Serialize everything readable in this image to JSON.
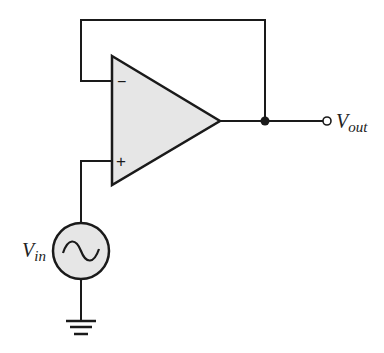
{
  "diagram": {
    "type": "op-amp voltage follower",
    "labels": {
      "input_main": "V",
      "input_sub": "in",
      "output_main": "V",
      "output_sub": "out",
      "inverting_symbol": "−",
      "noninverting_symbol": "+"
    },
    "colors": {
      "stroke": "#1a1a1a",
      "fill": "#e6e6e6",
      "background": "#ffffff"
    }
  }
}
